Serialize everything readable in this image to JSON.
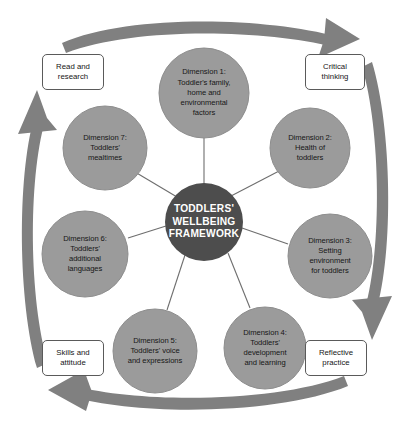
{
  "diagram": {
    "title": "Toddlers' Wellbeing Framework",
    "center": {
      "label_line1": "TODDLERS'",
      "label_line2": "WELLBEING",
      "label_line3": "FRAMEWORK",
      "color": "#4d4d4d",
      "text_color": "#ffffff"
    },
    "colors": {
      "circle_fill": "#9b9b9b",
      "circle_stroke": "#8a8a8a",
      "center_fill": "#4d4d4d",
      "arrow_fill": "#808080",
      "connector_line": "#6e6e6e",
      "box_border": "#5a5a5a",
      "box_fill": "#ffffff",
      "text_dark": "#161616",
      "background": "#ffffff"
    },
    "dimensions": [
      {
        "id": "dimension-1",
        "heading": "Dimension 1:",
        "lines": [
          "Dimension 1:",
          "Toddler's family,",
          "home and",
          "environmental",
          "factors"
        ],
        "cx": 204,
        "cy": 93,
        "r": 45
      },
      {
        "id": "dimension-2",
        "heading": "Dimension 2:",
        "lines": [
          "Dimension 2:",
          "Health of",
          "toddlers"
        ],
        "cx": 310,
        "cy": 148,
        "r": 40
      },
      {
        "id": "dimension-3",
        "heading": "Dimension 3:",
        "lines": [
          "Dimension 3:",
          "Setting",
          "environment",
          "for toddlers"
        ],
        "cx": 330,
        "cy": 256,
        "r": 42
      },
      {
        "id": "dimension-4",
        "heading": "Dimension 4:",
        "lines": [
          "Dimension 4:",
          "Toddlers'",
          "development",
          "and learning"
        ],
        "cx": 265,
        "cy": 348,
        "r": 41
      },
      {
        "id": "dimension-5",
        "heading": "Dimension 5:",
        "lines": [
          "Dimension 5:",
          "Toddlers' voice",
          "and expressions"
        ],
        "cx": 155,
        "cy": 351,
        "r": 42
      },
      {
        "id": "dimension-6",
        "heading": "Dimension 6:",
        "lines": [
          "Dimension 6:",
          "Toddlers'",
          "additional",
          "languages"
        ],
        "cx": 85,
        "cy": 254,
        "r": 43
      },
      {
        "id": "dimension-7",
        "heading": "Dimension 7:",
        "lines": [
          "Dimension 7:",
          "Toddlers'",
          "mealtimes"
        ],
        "cx": 105,
        "cy": 148,
        "r": 42
      }
    ],
    "corner_boxes": [
      {
        "id": "read-and-research",
        "lines": [
          "Read and",
          "research"
        ],
        "x": 42,
        "y": 54,
        "w": 62,
        "h": 36
      },
      {
        "id": "critical-thinking",
        "lines": [
          "Critical",
          "thinking"
        ],
        "x": 305,
        "y": 54,
        "w": 60,
        "h": 36
      },
      {
        "id": "reflective-practice",
        "lines": [
          "Reflective",
          "practice"
        ],
        "x": 305,
        "y": 340,
        "w": 62,
        "h": 36
      },
      {
        "id": "skills-and-attitude",
        "lines": [
          "Skills and",
          "attitude"
        ],
        "x": 42,
        "y": 340,
        "w": 62,
        "h": 36
      }
    ],
    "arrows": [
      {
        "id": "arrow-top",
        "direction": "clockwise-top-right"
      },
      {
        "id": "arrow-right",
        "direction": "clockwise-right-down"
      },
      {
        "id": "arrow-bottom",
        "direction": "clockwise-bottom-left"
      },
      {
        "id": "arrow-left",
        "direction": "clockwise-left-up"
      }
    ]
  }
}
